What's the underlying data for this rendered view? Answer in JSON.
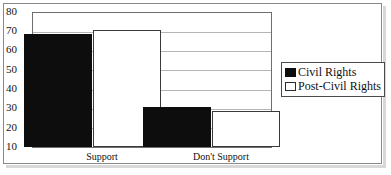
{
  "chart_data": {
    "type": "bar",
    "title": "",
    "subtitle": "",
    "xlabel": "",
    "ylabel": "",
    "categories": [
      "Support",
      "Don't Support"
    ],
    "series": [
      {
        "name": "Civil Rights",
        "values": [
          69,
          31
        ],
        "color": "#0d0d0d",
        "style": "filled-black"
      },
      {
        "name": "Post-Civil Rights",
        "values": [
          71,
          29
        ],
        "color": "#ffffff",
        "style": "outlined-white"
      }
    ],
    "ylim": [
      10,
      80
    ],
    "ytick_step": 10,
    "yticks": [
      10,
      20,
      30,
      40,
      50,
      60,
      70,
      80
    ],
    "ytick_labels": [
      "10",
      "20",
      "30",
      "40",
      "50",
      "60",
      "70",
      "80"
    ],
    "grid": true,
    "grid_axis": "y",
    "legend_position": "right-middle",
    "legend_entries": [
      "Civil Rights",
      "Post-Civil Rights"
    ],
    "annotations": []
  },
  "frame": {
    "border_color": "#8a8a8a",
    "plot_border_color": "#6e6e6e",
    "gridline_color": "#b5b5b5",
    "background": "#ffffff"
  }
}
